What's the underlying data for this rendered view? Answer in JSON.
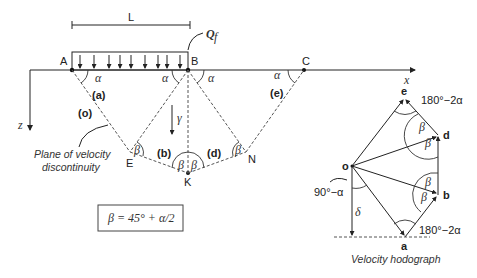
{
  "mechanism": {
    "dimension_label": "L",
    "load_label": "Q",
    "load_subscript": "f",
    "points": {
      "A": "A",
      "B": "B",
      "C": "C",
      "E": "E",
      "K": "K",
      "N": "N"
    },
    "axis_x": "x",
    "axis_z": "z",
    "unit_weight": "γ",
    "alpha": "α",
    "beta": "β",
    "blocks": {
      "o": "(o)",
      "a": "(a)",
      "b": "(b)",
      "d": "(d)",
      "e": "(e)"
    },
    "annotation_line1": "Plane of velocity",
    "annotation_line2": "discontinuity",
    "formula": "β = 45° + α/2"
  },
  "hodograph": {
    "points": {
      "o": "o",
      "a": "a",
      "b": "b",
      "d": "d",
      "e": "e"
    },
    "angle_top": "180°−2α",
    "angle_bottom": "180°−2α",
    "angle_left": "90°−α",
    "delta": "δ",
    "beta": "β",
    "caption": "Velocity hodograph"
  }
}
